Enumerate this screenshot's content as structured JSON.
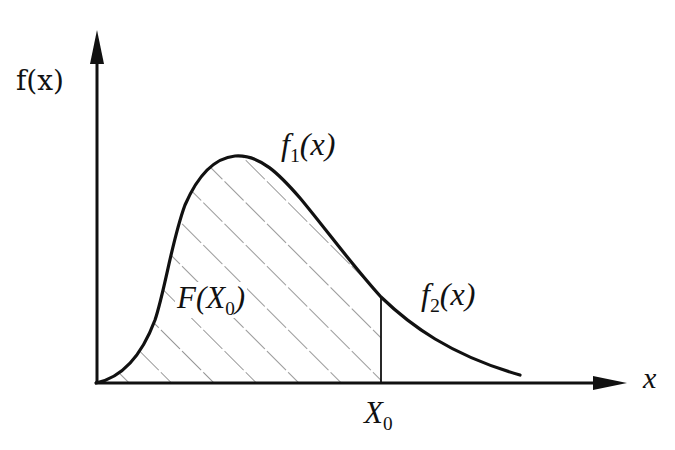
{
  "diagram": {
    "type": "probability-density-curve",
    "y_axis_label": "f(x)",
    "x_axis_label": "x",
    "curve_labels": {
      "f1": {
        "name": "f",
        "subscript": "1",
        "arg": "(x)"
      },
      "f2": {
        "name": "f",
        "subscript": "2",
        "arg": "(x)"
      }
    },
    "shaded_region_label": {
      "name": "F(X",
      "subscript": "0",
      "close": ")"
    },
    "x_marker_label": {
      "name": "X",
      "subscript": "0"
    },
    "colors": {
      "ink": "#111111",
      "background": "#ffffff",
      "hatch": "#444444"
    }
  }
}
